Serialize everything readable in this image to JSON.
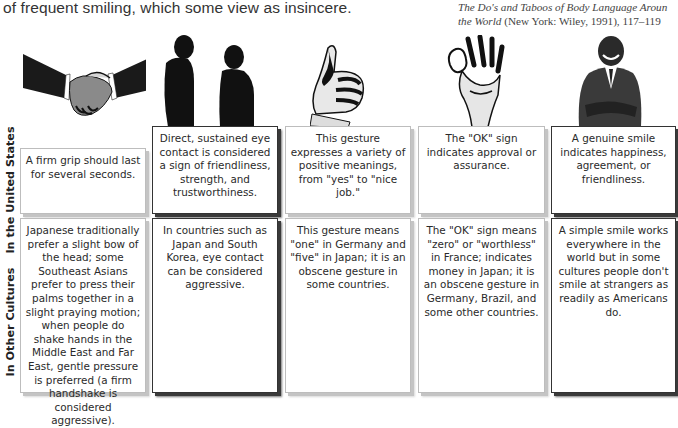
{
  "intro_text": "of frequent smiling, which some view as insincere.",
  "citation": {
    "line1_italic": "The Do's and Taboos of Body Language Aroun",
    "line2_italic": "the World",
    "line2_rest": " (New York: Wiley, 1991), 117–119"
  },
  "row_labels": {
    "us": "In the United States",
    "other": "In Other Cultures"
  },
  "images": [
    {
      "icon": "handshake-icon"
    },
    {
      "icon": "two-people-facing-icon"
    },
    {
      "icon": "thumbs-up-icon"
    },
    {
      "icon": "ok-sign-hand-icon"
    },
    {
      "icon": "smiling-man-icon"
    }
  ],
  "us_row": [
    "A firm grip should last for several seconds.",
    "Direct, sustained eye contact is considered a sign of friendliness, strength, and trustworthiness.",
    "This gesture expresses a variety of positive meanings, from \"yes\" to \"nice job.\"",
    "The \"OK\" sign indicates approval or assurance.",
    "A genuine smile indicates happiness, agreement, or friendliness."
  ],
  "other_row": [
    "Japanese traditionally prefer a slight bow of the head; some Southeast Asians prefer to press their palms together in a slight praying motion; when people do shake hands in the Middle East and Far East, gentle pressure is preferred (a firm handshake is considered aggressive).",
    "In countries such as Japan and South Korea, eye contact can be considered aggressive.",
    "This gesture means \"one\" in Germany and \"five\" in Japan; it is an obscene gesture in some countries.",
    "The \"OK\" sign means \"zero\" or \"worthless\" in France; indicates money in Japan; it is an obscene gesture in Germany, Brazil, and some other countries.",
    "A simple smile works everywhere in the world but in some cultures people don't smile at strangers as readily as Americans do."
  ]
}
